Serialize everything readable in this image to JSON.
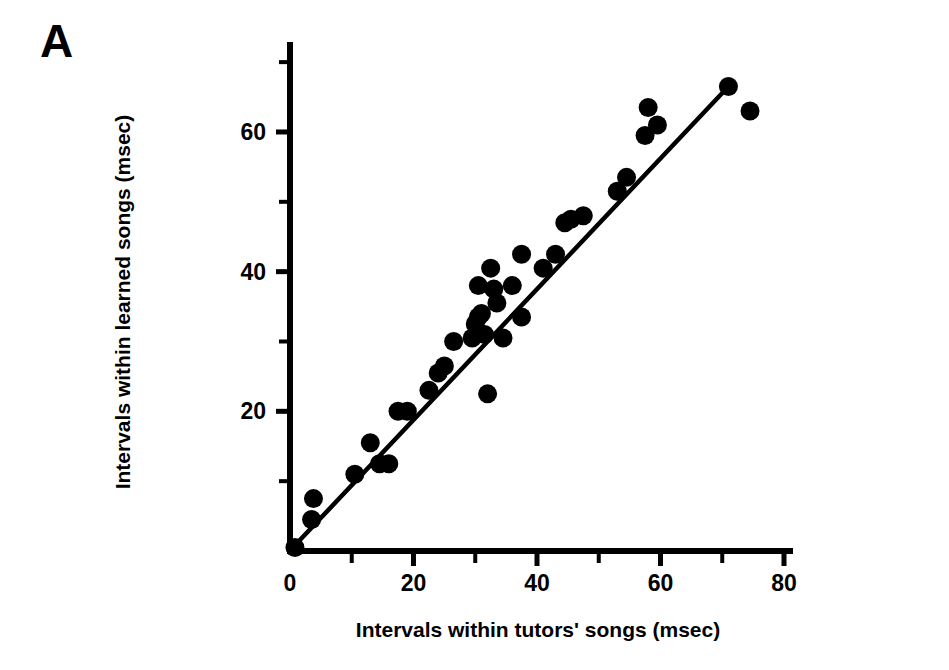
{
  "panel": {
    "label": "A"
  },
  "chart_data": {
    "type": "scatter",
    "title": "",
    "subtitle": "",
    "xlabel": "Intervals within tutors' songs (msec)",
    "ylabel": "Intervals within learned songs (msec)",
    "xlim": [
      0,
      82
    ],
    "ylim": [
      0,
      71
    ],
    "xticks": [
      0,
      20,
      40,
      60,
      80
    ],
    "xtick_labels": [
      "0",
      "20",
      "40",
      "60",
      "80"
    ],
    "xminor_ticks": [
      10,
      30,
      50,
      70
    ],
    "yticks": [
      20,
      40,
      60
    ],
    "ytick_labels": [
      "20",
      "40",
      "60"
    ],
    "yminor_ticks": [
      10,
      30,
      50,
      70
    ],
    "grid": false,
    "legend": null,
    "marker": "filled-circle",
    "marker_color": "#000000",
    "line_color": "#000000",
    "fit_line": {
      "type": "linear-regression",
      "x_start": 1.0,
      "y_start": 1.0,
      "x_end": 71.0,
      "y_end": 66.5
    },
    "points": [
      {
        "x": 0.8,
        "y": 0.5
      },
      {
        "x": 3.5,
        "y": 4.5
      },
      {
        "x": 3.8,
        "y": 7.5
      },
      {
        "x": 10.5,
        "y": 11.0
      },
      {
        "x": 13.0,
        "y": 15.5
      },
      {
        "x": 14.5,
        "y": 12.5
      },
      {
        "x": 16.0,
        "y": 12.5
      },
      {
        "x": 17.5,
        "y": 20.0
      },
      {
        "x": 19.0,
        "y": 20.0
      },
      {
        "x": 22.5,
        "y": 23.0
      },
      {
        "x": 24.0,
        "y": 25.5
      },
      {
        "x": 25.0,
        "y": 26.5
      },
      {
        "x": 26.5,
        "y": 30.0
      },
      {
        "x": 29.5,
        "y": 30.5
      },
      {
        "x": 30.0,
        "y": 32.5
      },
      {
        "x": 30.5,
        "y": 33.5
      },
      {
        "x": 31.0,
        "y": 34.0
      },
      {
        "x": 31.5,
        "y": 31.0
      },
      {
        "x": 30.5,
        "y": 38.0
      },
      {
        "x": 32.5,
        "y": 40.5
      },
      {
        "x": 32.0,
        "y": 22.5
      },
      {
        "x": 33.5,
        "y": 35.5
      },
      {
        "x": 34.5,
        "y": 30.5
      },
      {
        "x": 33.0,
        "y": 37.5
      },
      {
        "x": 36.0,
        "y": 38.0
      },
      {
        "x": 37.5,
        "y": 42.5
      },
      {
        "x": 37.5,
        "y": 33.5
      },
      {
        "x": 41.0,
        "y": 40.5
      },
      {
        "x": 43.0,
        "y": 42.5
      },
      {
        "x": 44.5,
        "y": 47.0
      },
      {
        "x": 45.5,
        "y": 47.5
      },
      {
        "x": 47.5,
        "y": 48.0
      },
      {
        "x": 53.0,
        "y": 51.5
      },
      {
        "x": 54.5,
        "y": 53.5
      },
      {
        "x": 57.5,
        "y": 59.5
      },
      {
        "x": 58.0,
        "y": 63.5
      },
      {
        "x": 59.5,
        "y": 61.0
      },
      {
        "x": 71.0,
        "y": 66.5
      },
      {
        "x": 74.5,
        "y": 63.0
      }
    ]
  },
  "axes": {
    "x_axis_name": "x-axis",
    "y_axis_name": "y-axis"
  }
}
